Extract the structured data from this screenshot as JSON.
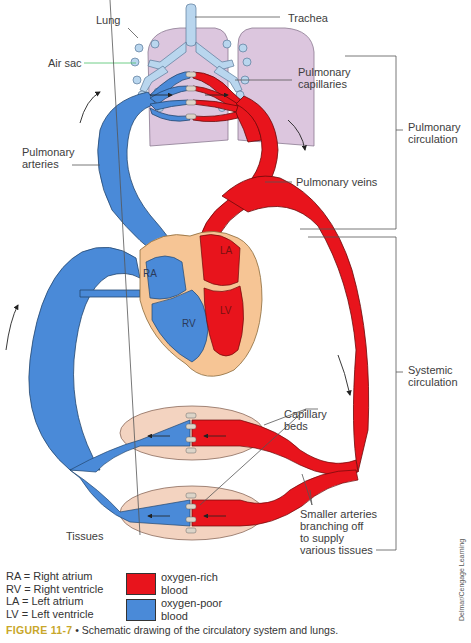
{
  "labels": {
    "lung": "Lung",
    "trachea": "Trachea",
    "air_sac": "Air sac",
    "pulmonary_capillaries": "Pulmonary\ncapillaries",
    "pulmonary_circulation": "Pulmonary\ncirculation",
    "pulmonary_arteries": "Pulmonary\narteries",
    "pulmonary_veins": "Pulmonary veins",
    "systemic_circulation": "Systemic\ncirculation",
    "capillary_beds": "Capillary\nbeds",
    "tissues": "Tissues",
    "smaller_arteries": "Smaller arteries\nbranching off\nto supply\nvarious tissues"
  },
  "heart_chambers": {
    "ra": "RA",
    "rv": "RV",
    "la": "LA",
    "lv": "LV"
  },
  "legend": {
    "abbreviations": [
      "RA = Right atrium",
      "RV = Right ventricle",
      "LA = Left atrium",
      "LV = Left ventricle"
    ],
    "swatches": [
      {
        "label": "oxygen-rich\nblood",
        "color": "#e8141c"
      },
      {
        "label": "oxygen-poor\nblood",
        "color": "#4a8ad8"
      }
    ]
  },
  "caption": {
    "figure_label": "FIGURE 11-7",
    "separator": " • ",
    "text": "Schematic drawing of the circulatory system and lungs."
  },
  "credit": "Delmar/Cengage Learning",
  "colors": {
    "oxygen_rich": "#e8141c",
    "oxygen_poor": "#4a8ad8",
    "lung": "#dcc6de",
    "airway": "#b9d6ee",
    "heart_tissue": "#f6c595",
    "tissue_bed": "#f3d3c0",
    "figure_label": "#c8a72a"
  }
}
